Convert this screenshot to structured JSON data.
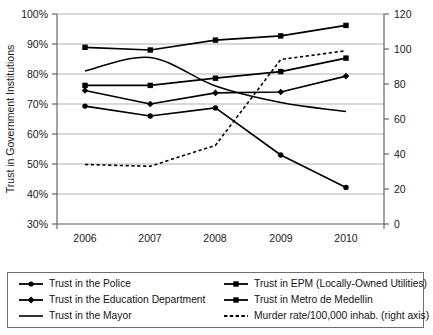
{
  "chart_data": {
    "type": "line",
    "title": "",
    "xlabel": "",
    "ylabel": "Trust in Government Institutions",
    "y2label": "",
    "categories": [
      "2006",
      "2007",
      "2008",
      "2009",
      "2010"
    ],
    "ylim": [
      30,
      100
    ],
    "y2lim": [
      0,
      120
    ],
    "yticks": [
      "30%",
      "40%",
      "50%",
      "60%",
      "70%",
      "80%",
      "90%",
      "100%"
    ],
    "y2ticks": [
      "0",
      "20",
      "40",
      "60",
      "80",
      "100",
      "120"
    ],
    "grid": true,
    "legend_position": "bottom",
    "series": [
      {
        "name": "Trust in the Police",
        "axis": "left",
        "marker": "circle",
        "style": "solid",
        "values": [
          69.3,
          66.0,
          68.7,
          53.0,
          42.2
        ]
      },
      {
        "name": "Trust in the Education Department",
        "axis": "left",
        "marker": "diamond",
        "style": "solid",
        "values": [
          74.5,
          70.0,
          73.7,
          74.0,
          79.3
        ]
      },
      {
        "name": "Trust in the Mayor",
        "axis": "left",
        "marker": "none",
        "style": "solid-smooth",
        "values": [
          81.0,
          85.5,
          76.0,
          70.5,
          67.5
        ]
      },
      {
        "name": "Trust in EPM (Locally-Owned Utilities)",
        "axis": "left",
        "marker": "square",
        "style": "solid",
        "values": [
          88.9,
          88.0,
          91.3,
          92.7,
          96.2
        ]
      },
      {
        "name": "Trust in Metro de Medellin",
        "axis": "left",
        "marker": "square",
        "style": "solid",
        "values": [
          76.2,
          76.2,
          78.6,
          80.8,
          85.3
        ]
      },
      {
        "name": "Murder rate/100,000 inhab. (right axis)",
        "axis": "right",
        "marker": "none",
        "style": "dashed",
        "values": [
          34.0,
          33.0,
          45.0,
          94.0,
          99.0
        ]
      }
    ]
  },
  "legend": {
    "items": [
      {
        "label": "Trust in the Police",
        "swatch": "line-circle-marker"
      },
      {
        "label": "Trust in EPM (Locally-Owned Utilities)",
        "swatch": "line-square-marker"
      },
      {
        "label": "Trust in the Education Department",
        "swatch": "line-diamond-marker"
      },
      {
        "label": "Trust in Metro de Medellin",
        "swatch": "line-square-marker"
      },
      {
        "label": "Trust in the Mayor",
        "swatch": "line-plain"
      },
      {
        "label": "Murder rate/100,000 inhab. (right axis)",
        "swatch": "line-dashed"
      }
    ]
  }
}
